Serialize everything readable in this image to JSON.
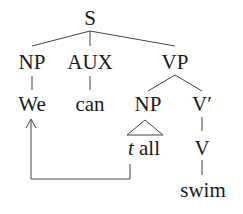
{
  "tree": {
    "root": "S",
    "level1": {
      "np": "NP",
      "aux": "AUX",
      "vp": "VP"
    },
    "level2": {
      "we": "We",
      "can": "can",
      "vp_np": "NP",
      "v_bar": "V′"
    },
    "level3": {
      "trace": "t",
      "all": "all",
      "v": "V"
    },
    "level4": {
      "swim": "swim"
    }
  },
  "movement_arrow": {
    "from": "t",
    "to": "We"
  }
}
